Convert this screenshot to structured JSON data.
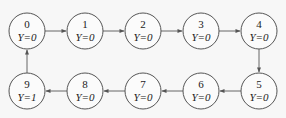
{
  "diagram": {
    "type": "state-chain",
    "colors": {
      "stroke": "#555555",
      "background": "#f7f7f7",
      "text": "#222222"
    },
    "nodes": [
      {
        "id": "0",
        "label": "0",
        "value": "Y=0",
        "cx": 27,
        "cy": 31
      },
      {
        "id": "1",
        "label": "1",
        "value": "Y=0",
        "cx": 85,
        "cy": 31
      },
      {
        "id": "2",
        "label": "2",
        "value": "Y=0",
        "cx": 143,
        "cy": 31
      },
      {
        "id": "3",
        "label": "3",
        "value": "Y=0",
        "cx": 201,
        "cy": 31
      },
      {
        "id": "4",
        "label": "4",
        "value": "Y=0",
        "cx": 259,
        "cy": 31
      },
      {
        "id": "5",
        "label": "5",
        "value": "Y=0",
        "cx": 259,
        "cy": 91
      },
      {
        "id": "6",
        "label": "6",
        "value": "Y=0",
        "cx": 201,
        "cy": 91
      },
      {
        "id": "7",
        "label": "7",
        "value": "Y=0",
        "cx": 143,
        "cy": 91
      },
      {
        "id": "8",
        "label": "8",
        "value": "Y=0",
        "cx": 85,
        "cy": 91
      },
      {
        "id": "9",
        "label": "9",
        "value": "Y=1",
        "cx": 27,
        "cy": 91
      }
    ],
    "edges": [
      {
        "from": "0",
        "to": "1"
      },
      {
        "from": "1",
        "to": "2"
      },
      {
        "from": "2",
        "to": "3"
      },
      {
        "from": "3",
        "to": "4"
      },
      {
        "from": "4",
        "to": "5"
      },
      {
        "from": "5",
        "to": "6"
      },
      {
        "from": "6",
        "to": "7"
      },
      {
        "from": "7",
        "to": "8"
      },
      {
        "from": "8",
        "to": "9"
      },
      {
        "from": "9",
        "to": "0"
      }
    ]
  }
}
